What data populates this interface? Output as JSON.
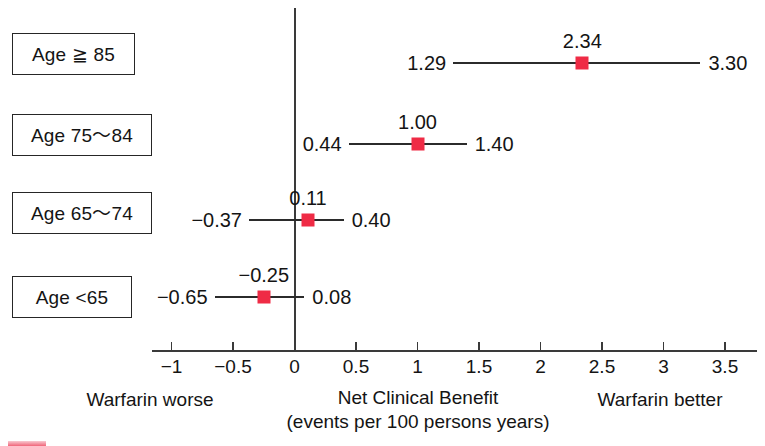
{
  "chart_data": {
    "type": "forest",
    "title": "",
    "xlabel": "Net Clinical Benefit",
    "xlabel_sub": "(events per 100 persons years)",
    "left_annotation": "Warfarin worse",
    "right_annotation": "Warfarin better",
    "xlim": [
      -1.15,
      3.75
    ],
    "grid": false,
    "legend": "none",
    "reference_line": 0,
    "marker_color": "#ef2b45",
    "line_color": "#2b2b2b",
    "tick_labels": [
      "−1",
      "−0.5",
      "0",
      "0.5",
      "1",
      "1.5",
      "2",
      "2.5",
      "3",
      "3.5"
    ],
    "tick_values": [
      -1,
      -0.5,
      0,
      0.5,
      1,
      1.5,
      2,
      2.5,
      3,
      3.5
    ],
    "categories": [
      "Age ≧ 85",
      "Age 75～84",
      "Age 65～74",
      "Age <65"
    ],
    "rows": [
      {
        "label": "Age ≧ 85",
        "estimate": 2.34,
        "lower": 1.29,
        "upper": 3.3,
        "estimate_text": "2.34",
        "lower_text": "1.29",
        "upper_text": "3.30"
      },
      {
        "label": "Age 75～84",
        "estimate": 1.0,
        "lower": 0.44,
        "upper": 1.4,
        "estimate_text": "1.00",
        "lower_text": "0.44",
        "upper_text": "1.40"
      },
      {
        "label": "Age 65～74",
        "estimate": 0.11,
        "lower": -0.37,
        "upper": 0.4,
        "estimate_text": "0.11",
        "lower_text": "−0.37",
        "upper_text": "0.40"
      },
      {
        "label": "Age <65",
        "estimate": -0.25,
        "lower": -0.65,
        "upper": 0.08,
        "estimate_text": "−0.25",
        "lower_text": "−0.65",
        "upper_text": "0.08"
      }
    ]
  }
}
